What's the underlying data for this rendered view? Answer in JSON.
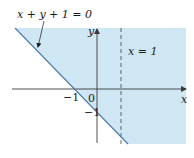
{
  "figure": {
    "colors": {
      "region_fill": "#cfe6f3",
      "boundary_line": "#4a7aa8",
      "axis": "#3a3a3a",
      "dashed_line": "#555555",
      "text": "#1a1a1a"
    },
    "labels": {
      "boundary_equation": "x + y + 1 = 0",
      "vertical_line": "x = 1",
      "x_axis": "x",
      "y_axis": "y",
      "origin": "0",
      "x_intercept": "−1",
      "y_intercept": "−1"
    },
    "geometry": {
      "origin_px": [
        97,
        89
      ],
      "unit_px": 23,
      "boundary_line": {
        "slope": -1,
        "intercept": -1
      },
      "vertical_line_x": 1,
      "x_intercept": -1,
      "y_intercept": -1
    }
  }
}
